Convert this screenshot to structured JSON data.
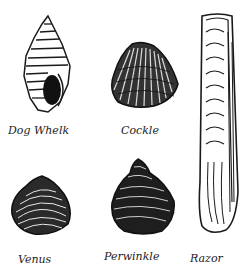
{
  "illustration": {
    "background": "#ffffff",
    "ink": "#1a1a1a",
    "shells": [
      {
        "id": "dog-whelk",
        "label": "Dog Whelk"
      },
      {
        "id": "cockle",
        "label": "Cockle"
      },
      {
        "id": "venus",
        "label": "Venus"
      },
      {
        "id": "periwinkle",
        "label": "Perwinkle"
      },
      {
        "id": "razor",
        "label": "Razor"
      }
    ]
  }
}
